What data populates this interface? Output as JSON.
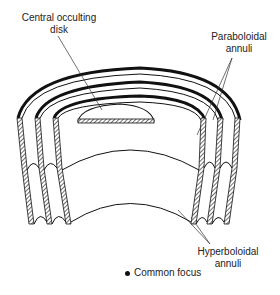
{
  "diagram": {
    "labels": {
      "disk_line1": "Central occulting",
      "disk_line2": "disk",
      "para_line1": "Paraboloidal",
      "para_line2": "annuli",
      "hyper_line1": "Hyperboloidal",
      "hyper_line2": "annuli",
      "focus": "Common focus"
    },
    "colors": {
      "ink": "#1a1a1a",
      "background": "#ffffff"
    }
  }
}
